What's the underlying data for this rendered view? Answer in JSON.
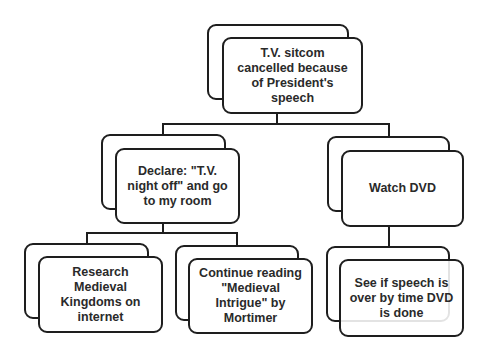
{
  "diagram": {
    "type": "hierarchy",
    "root": {
      "label": "T.V. sitcom\ncancelled because\nof President's\nspeech"
    },
    "level2": [
      {
        "label": "Declare: \"T.V.\nnight off\" and go\nto my room"
      },
      {
        "label": "Watch DVD"
      }
    ],
    "level3": [
      {
        "parent": 0,
        "label": "Research\nMedieval\nKingdoms on\ninternet"
      },
      {
        "parent": 0,
        "label": "Continue reading\n\"Medieval\nIntrigue\" by\nMortimer"
      },
      {
        "parent": 1,
        "label": "See if speech is\nover by time DVD\nis done"
      }
    ],
    "colors": {
      "stroke": "#1e1e1e",
      "fill": "#ffffff",
      "text": "#2a2a2a"
    }
  }
}
